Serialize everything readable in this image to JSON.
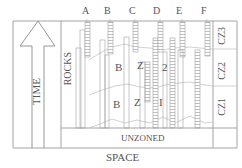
{
  "diagram": {
    "title_x_axis": "SPACE",
    "title_y_axis": "TIME",
    "rocks_label": "ROCKS",
    "columns": [
      "A",
      "B",
      "C",
      "D",
      "E",
      "F"
    ],
    "zones": [
      {
        "id": "CZ3",
        "label": "CZ3"
      },
      {
        "id": "CZ2",
        "label": "CZ2",
        "letters": [
          "B",
          "Z",
          "2"
        ]
      },
      {
        "id": "CZ1",
        "label": "CZ1",
        "letters": [
          "B",
          "Z",
          "I"
        ]
      }
    ],
    "unzoned_label": "UNZONED",
    "colors": {
      "line": "#9a9a9a",
      "text": "#555555",
      "hatch": "#b5b5b5"
    }
  }
}
